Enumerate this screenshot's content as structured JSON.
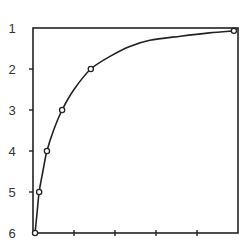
{
  "chart_data": {
    "type": "line",
    "title": "",
    "xlabel": "",
    "ylabel": "",
    "x_ticks": [
      "",
      "",
      "",
      ""
    ],
    "y_ticks": [
      "1",
      "2",
      "3",
      "4",
      "5",
      "6"
    ],
    "ylim": [
      6,
      1
    ],
    "xlim": [
      0,
      5
    ],
    "y_inverted": true,
    "grid": false,
    "legend": null,
    "series": [
      {
        "name": "curve",
        "marker": "open-circle",
        "points": [
          {
            "x": 0.05,
            "y": 6
          },
          {
            "x": 0.15,
            "y": 5
          },
          {
            "x": 0.34,
            "y": 4
          },
          {
            "x": 0.71,
            "y": 3
          },
          {
            "x": 1.41,
            "y": 2
          },
          {
            "x": 4.9,
            "y": 1.07
          }
        ],
        "smooth_path": [
          {
            "x": 0.05,
            "y": 6
          },
          {
            "x": 0.1,
            "y": 5.5
          },
          {
            "x": 0.15,
            "y": 5
          },
          {
            "x": 0.24,
            "y": 4.5
          },
          {
            "x": 0.34,
            "y": 4
          },
          {
            "x": 0.5,
            "y": 3.5
          },
          {
            "x": 0.71,
            "y": 3
          },
          {
            "x": 1.0,
            "y": 2.5
          },
          {
            "x": 1.41,
            "y": 2
          },
          {
            "x": 1.9,
            "y": 1.68
          },
          {
            "x": 2.36,
            "y": 1.45
          },
          {
            "x": 2.85,
            "y": 1.3
          },
          {
            "x": 3.6,
            "y": 1.2
          },
          {
            "x": 4.3,
            "y": 1.12
          },
          {
            "x": 4.9,
            "y": 1.07
          }
        ]
      }
    ]
  },
  "colors": {
    "line": "#222222",
    "axis": "#222222",
    "text": "#333333",
    "background": "#ffffff"
  }
}
